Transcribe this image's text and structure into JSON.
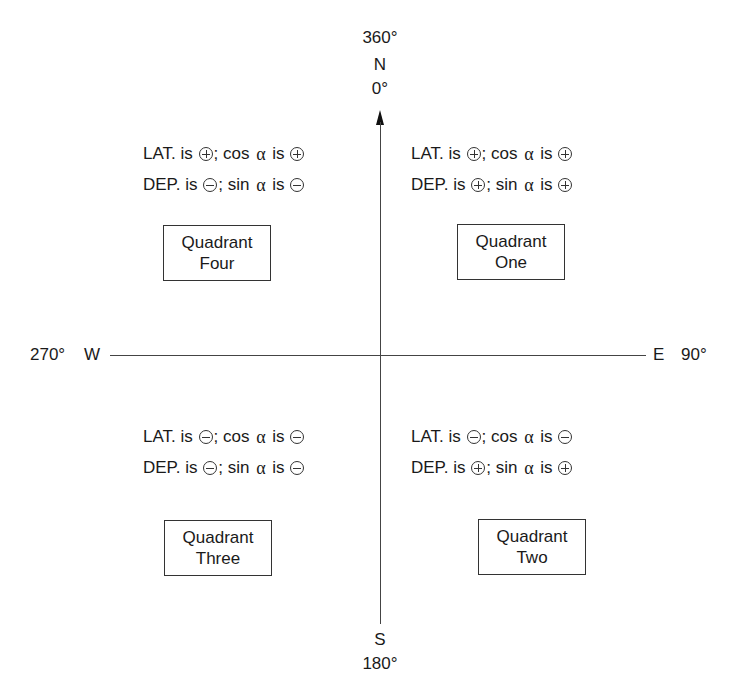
{
  "diagram": {
    "axes": {
      "north": {
        "top_label": "360°",
        "letter": "N",
        "bottom_label": "0°"
      },
      "south": {
        "letter": "S",
        "label": "180°"
      },
      "west": {
        "label": "270°",
        "letter": "W"
      },
      "east": {
        "letter": "E",
        "label": "90°"
      }
    },
    "quadrants": [
      {
        "id": "four",
        "box_line1": "Quadrant",
        "box_line2": "Four",
        "lat_prefix": "LAT. is",
        "lat_sign": "minus-plus",
        "cos_prefix": "; cos",
        "cos_alpha": "α",
        "cos_is": "is",
        "lat_sign_text": "⊕",
        "cos_sign_text": "⊕",
        "dep_prefix": "DEP. is",
        "sin_prefix": "; sin",
        "sin_alpha": "α",
        "sin_is": "is",
        "dep_sign_text": "⊖",
        "sin_sign_text": "⊖"
      },
      {
        "id": "one",
        "box_line1": "Quadrant",
        "box_line2": "One",
        "lat_prefix": "LAT. is",
        "cos_prefix": "; cos",
        "cos_alpha": "α",
        "cos_is": "is",
        "lat_sign_text": "⊕",
        "cos_sign_text": "⊕",
        "dep_prefix": "DEP. is",
        "sin_prefix": "; sin",
        "sin_alpha": "α",
        "sin_is": "is",
        "dep_sign_text": "⊕",
        "sin_sign_text": "⊕"
      },
      {
        "id": "three",
        "box_line1": "Quadrant",
        "box_line2": "Three",
        "lat_prefix": "LAT. is",
        "cos_prefix": "; cos",
        "cos_alpha": "α",
        "cos_is": "is",
        "lat_sign_text": "⊖",
        "cos_sign_text": "⊖",
        "dep_prefix": "DEP. is",
        "sin_prefix": "; sin",
        "sin_alpha": "α",
        "sin_is": "is",
        "dep_sign_text": "⊖",
        "sin_sign_text": "⊖"
      },
      {
        "id": "two",
        "box_line1": "Quadrant",
        "box_line2": "Two",
        "lat_prefix": "LAT. is",
        "cos_prefix": "; cos",
        "cos_alpha": "α",
        "cos_is": "is",
        "lat_sign_text": "⊖",
        "cos_sign_text": "⊖",
        "dep_prefix": "DEP. is",
        "sin_prefix": "; sin",
        "sin_alpha": "α",
        "sin_is": "is",
        "dep_sign_text": "⊕",
        "sin_sign_text": "⊕"
      }
    ]
  }
}
